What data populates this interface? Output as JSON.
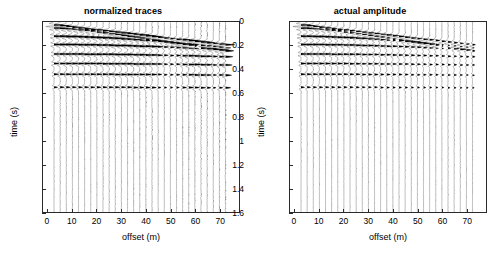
{
  "figure": {
    "background": "#ffffff",
    "trace_color": "#000000",
    "axis_color": "#2a2a2a"
  },
  "panels": [
    {
      "id": "normalized",
      "title": "normalized traces",
      "xlabel": "offset (m)",
      "ylabel": "time (s)"
    },
    {
      "id": "actual",
      "title": "actual amplitude",
      "xlabel": "offset (m)",
      "ylabel": "time (s)"
    }
  ],
  "axes": {
    "x_ticks": [
      0,
      10,
      20,
      30,
      40,
      50,
      60,
      70
    ],
    "x_tick_labels": [
      "0",
      "10",
      "20",
      "30",
      "40",
      "50",
      "60",
      "70"
    ],
    "y_ticks": [
      0,
      0.2,
      0.4,
      0.6,
      0.8,
      1,
      1.2,
      1.4,
      1.6
    ],
    "y_tick_labels": [
      "0",
      "0.2",
      "0.4",
      "0.6",
      "0.8",
      "1",
      "1.2",
      "1.4",
      "1.6"
    ],
    "xlim": [
      -2,
      78
    ],
    "ylim": [
      0,
      1.6
    ]
  },
  "chart_data": {
    "type": "line",
    "xlabel": "offset (m)",
    "ylabel": "time (s)",
    "xlim": [
      -2,
      78
    ],
    "ylim": [
      0,
      1.6
    ],
    "y_inverted": true,
    "grid": false,
    "legend": "none",
    "plot_style": "variable-area wiggle (seismic trace display)",
    "trace_offsets_m": [
      2.5,
      5,
      7.5,
      10,
      12.5,
      15,
      17.5,
      20,
      22.5,
      25,
      27.5,
      30,
      32.5,
      35,
      37.5,
      40,
      42.5,
      45,
      47.5,
      50,
      52.5,
      55,
      57.5,
      60,
      62.5,
      65,
      67.5,
      70,
      72.5
    ],
    "trace_spacing_m": 2.5,
    "n_traces": 29,
    "sample_rate_s": 0.002,
    "wavelet_dominant_freq_hz": 30,
    "events": [
      {
        "name": "direct-wave / refraction",
        "t0_s": 0.02,
        "velocity_mps": 420,
        "type": "linear",
        "amplitude": 1.0
      },
      {
        "name": "reflection-1",
        "t0_s": 0.05,
        "velocity_mps": 300,
        "type": "hyperbolic",
        "amplitude": 0.95
      },
      {
        "name": "reflection-2",
        "t0_s": 0.12,
        "velocity_mps": 400,
        "type": "hyperbolic",
        "amplitude": 0.9
      },
      {
        "name": "reflection-3",
        "t0_s": 0.19,
        "velocity_mps": 520,
        "type": "hyperbolic",
        "amplitude": 0.85
      },
      {
        "name": "reflection-4",
        "t0_s": 0.27,
        "velocity_mps": 640,
        "type": "hyperbolic",
        "amplitude": 0.8
      },
      {
        "name": "reflection-5",
        "t0_s": 0.35,
        "velocity_mps": 760,
        "type": "hyperbolic",
        "amplitude": 0.75
      },
      {
        "name": "reflection-6",
        "t0_s": 0.44,
        "velocity_mps": 900,
        "type": "hyperbolic",
        "amplitude": 0.7
      },
      {
        "name": "reflection-7",
        "t0_s": 0.55,
        "velocity_mps": 1050,
        "type": "hyperbolic",
        "amplitude": 0.6
      }
    ],
    "series": [
      {
        "name": "normalized traces",
        "panel": "normalized",
        "description": "each trace scaled to unit maximum so deep/far arrivals remain visible",
        "gain_mode": "trace-normalized",
        "max_trace_amplitude_units": 1.0,
        "visible_time_range_s": [
          0.0,
          1.6
        ]
      },
      {
        "name": "actual amplitude",
        "panel": "actual",
        "description": "true relative amplitudes; near-offset early arrivals dominate and clip, far/deep energy nearly invisible",
        "gain_mode": "true-amplitude",
        "max_trace_amplitude_units": 1.0,
        "amplitude_decay_exponent": 2.0,
        "visible_time_range_s": [
          0.0,
          0.45
        ]
      }
    ]
  }
}
